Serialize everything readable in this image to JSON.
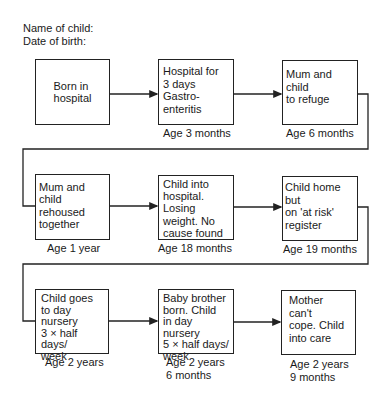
{
  "header": {
    "name_label": "Name of child:",
    "dob_label": "Date of birth:"
  },
  "boxes": [
    {
      "text": "Born in\nhospital",
      "age": ""
    },
    {
      "text": "Hospital for\n3 days\nGastro-\nenteritis",
      "age": "Age 3 months"
    },
    {
      "text": "Mum and child\nto refuge",
      "age": "Age 6 months"
    },
    {
      "text": "Mum and child\nrehoused\ntogether",
      "age": "Age 1 year"
    },
    {
      "text": "Child into\nhospital.\nLosing\nweight. No\ncause found",
      "age": "Age 18 months"
    },
    {
      "text": "Child home but\non 'at risk'\nregister",
      "age": "Age 19 months"
    },
    {
      "text": "Child goes\nto day\nnursery\n3 × half days/\nweek",
      "age": "Age 2 years"
    },
    {
      "text": "Baby brother\nborn. Child\nin day nursery\n5 × half days/\nweek",
      "age": "Age 2 years\n6 months"
    },
    {
      "text": "Mother can't\ncope. Child\ninto care",
      "age": "Age 2 years\n9 months"
    }
  ],
  "colors": {
    "line": "#222222",
    "text": "#1a1a1a",
    "background": "#ffffff"
  }
}
